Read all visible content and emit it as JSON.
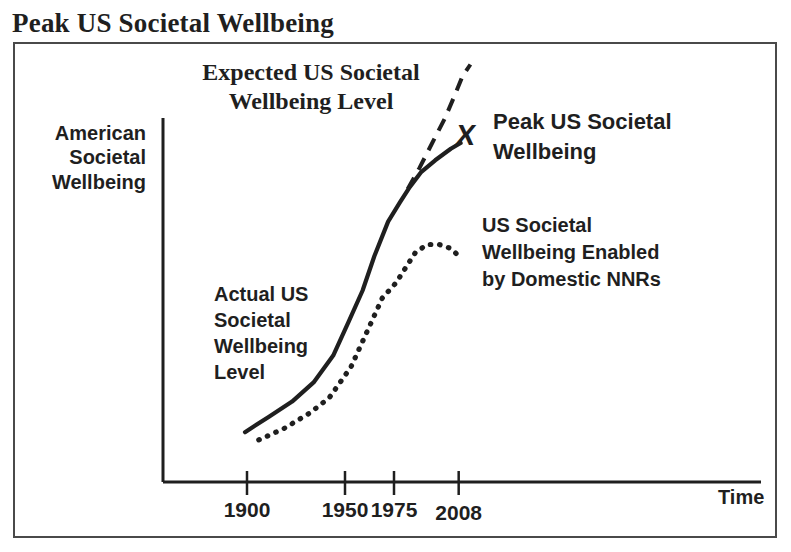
{
  "page": {
    "title": "Peak US Societal Wellbeing"
  },
  "colors": {
    "ink": "#1f1f1f",
    "border": "#4a4a4a",
    "background": "#ffffff"
  },
  "labels": {
    "expected": {
      "lines": [
        "Expected US Societal",
        "Wellbeing Level"
      ]
    },
    "peak": {
      "lines": [
        "Peak US Societal",
        "Wellbeing"
      ]
    },
    "nnr": {
      "lines": [
        "US Societal",
        "Wellbeing Enabled",
        "by Domestic NNRs"
      ]
    },
    "american": {
      "lines": [
        "American",
        "Societal",
        "Wellbeing"
      ]
    },
    "actual": {
      "lines": [
        "Actual US",
        "Societal",
        "Wellbeing",
        "Level"
      ]
    },
    "time": "Time"
  },
  "chart_data": {
    "type": "line",
    "title": "Peak US Societal Wellbeing",
    "xlabel": "Time",
    "ylabel": "American Societal Wellbeing",
    "grid": false,
    "legend_position": "inline-annotations",
    "x_ticks": [
      {
        "label": "1900",
        "year": 1900,
        "dy": 0
      },
      {
        "label": "1950",
        "year": 1950,
        "dy": 0
      },
      {
        "label": "1975",
        "year": 1975,
        "dy": 0
      },
      {
        "label": "2008",
        "year": 2008,
        "dy": 3
      }
    ],
    "y_units": "conceptual wellbeing index (0-110, no numeric axis shown)",
    "series": [
      {
        "name": "Actual US Societal Wellbeing Level",
        "line_style": "solid",
        "points": [
          [
            1899,
            13
          ],
          [
            1911,
            17
          ],
          [
            1923,
            21
          ],
          [
            1934,
            26
          ],
          [
            1944,
            33
          ],
          [
            1952,
            42
          ],
          [
            1959,
            50
          ],
          [
            1965,
            59
          ],
          [
            1972,
            68
          ],
          [
            1978,
            73
          ],
          [
            1983,
            77
          ],
          [
            1989,
            81
          ],
          [
            1996,
            84
          ],
          [
            2004,
            87
          ],
          [
            2009,
            88.5
          ]
        ]
      },
      {
        "name": "Expected US Societal Wellbeing Level",
        "line_style": "dashed",
        "points": [
          [
            1982,
            76.5
          ],
          [
            1988,
            82
          ],
          [
            1994,
            88
          ],
          [
            2001,
            95
          ],
          [
            2006,
            101
          ],
          [
            2010,
            106
          ],
          [
            2014,
            109
          ]
        ]
      },
      {
        "name": "US Societal Wellbeing Enabled by Domestic NNRs",
        "line_style": "dotted",
        "points": [
          [
            1906,
            11
          ],
          [
            1919,
            14
          ],
          [
            1932,
            18
          ],
          [
            1942,
            22
          ],
          [
            1953,
            30
          ],
          [
            1961,
            39
          ],
          [
            1969,
            48
          ],
          [
            1976,
            52
          ],
          [
            1981,
            56
          ],
          [
            1986,
            60
          ],
          [
            1992,
            62
          ],
          [
            1998,
            62
          ],
          [
            2004,
            61
          ],
          [
            2008,
            59
          ]
        ]
      }
    ],
    "peak_marker": {
      "symbol": "X",
      "label": "Peak US Societal Wellbeing",
      "year": 2012,
      "value": 90.5
    },
    "axis_calibration": {
      "x0_px": 247,
      "year0": 1900,
      "px_per_year": 1.96,
      "y0_px": 482,
      "px_per_value": 3.83,
      "y_axis_x_px": 163,
      "y_axis_top_px": 118,
      "x_axis_y_px": 482,
      "x_axis_end_px": 761,
      "tick_half_up_px": 11,
      "tick_half_down_px": 13,
      "tick_label_y_px": 517
    }
  }
}
